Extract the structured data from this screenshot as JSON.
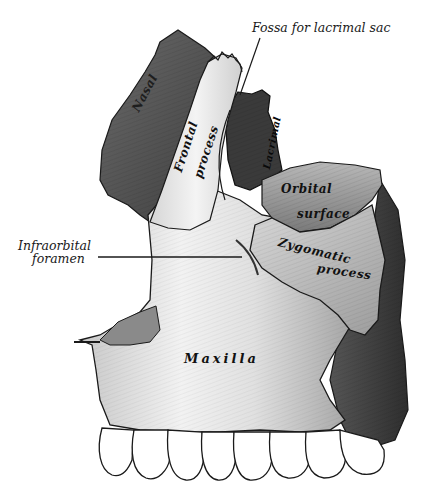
{
  "figure": {
    "labels": {
      "fossa_lacrimal_sac": "Fossa for lacrimal sac",
      "infraorbital_line1": "Infraorbital",
      "infraorbital_line2": "foramen",
      "nasal": "Nasal",
      "frontal_line1": "Frontal",
      "frontal_line2": "process",
      "lacrimal": "Lacrimal",
      "orbital_line1": "Orbital",
      "orbital_line2": "surface",
      "zygomatic_line1": "Zygomatic",
      "zygomatic_line2": "process",
      "maxilla": "Maxilla"
    },
    "colors": {
      "background": "#ffffff",
      "bone_light": "#e8e8e8",
      "bone_mid": "#a8a8a8",
      "bone_dark": "#4a4a4a",
      "outline": "#1a1a1a"
    }
  }
}
